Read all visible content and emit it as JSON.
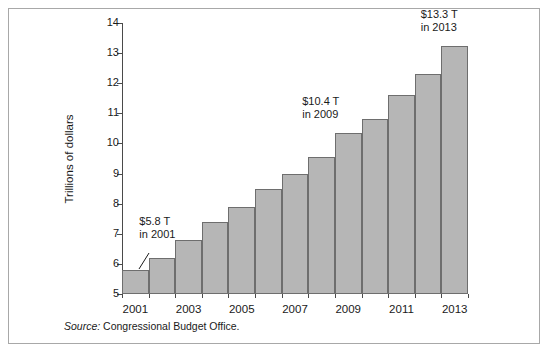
{
  "chart_data": {
    "type": "bar",
    "title": "",
    "xlabel": "",
    "ylabel": "Trillions of dollars",
    "ylim": [
      5,
      14
    ],
    "ytick_values": [
      14,
      13,
      12,
      11,
      10,
      9,
      8,
      7,
      6,
      5
    ],
    "ytick_labels": [
      "14",
      "13",
      "12",
      "11",
      "10",
      "9",
      "8",
      "7",
      "6",
      "5"
    ],
    "grid": false,
    "legend": "none",
    "categories": [
      2001,
      2002,
      2003,
      2004,
      2005,
      2006,
      2007,
      2008,
      2009,
      2010,
      2011,
      2012,
      2013
    ],
    "xtick_labels": [
      "2001",
      "2003",
      "2005",
      "2007",
      "2009",
      "2011",
      "2013"
    ],
    "xtick_label_years": [
      2001,
      2003,
      2005,
      2007,
      2009,
      2011,
      2013
    ],
    "values": [
      5.8,
      6.2,
      6.8,
      7.4,
      7.9,
      8.5,
      9.0,
      9.55,
      10.35,
      10.8,
      11.6,
      12.3,
      13.25
    ],
    "annotations": [
      {
        "year": 2001,
        "line1": "$5.8 T",
        "line2": "in 2001"
      },
      {
        "year": 2009,
        "line1": "$10.4 T",
        "line2": "in 2009"
      },
      {
        "year": 2013,
        "line1": "$13.3 T",
        "line2": "in 2013"
      }
    ],
    "bar_color": "#b6b6b6",
    "bar_edge_color": "#6e6e6e",
    "axis_color": "#4a4a4a"
  },
  "source": {
    "label": "Source:",
    "text": "Congressional Budget Office."
  }
}
